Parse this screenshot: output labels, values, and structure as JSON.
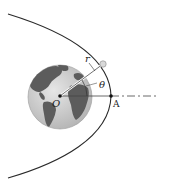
{
  "diagram": {
    "labels": {
      "radius": "r",
      "angle": "θ",
      "origin": "O",
      "perigee": "A"
    },
    "colors": {
      "orbit": "#2a2a2a",
      "axis": "#444444",
      "earth_ocean": "#cfcfcf",
      "earth_land": "#5a5a5a",
      "satellite": "#d9d9d9"
    }
  }
}
